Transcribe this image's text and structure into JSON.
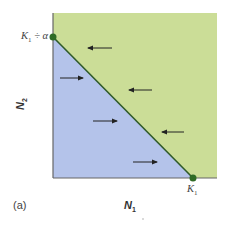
{
  "figure": {
    "panel_label": "(a)",
    "x_axis": {
      "label": "N",
      "label_sub": "1",
      "intercept_label": "K",
      "intercept_sub": "1"
    },
    "y_axis": {
      "label": "N",
      "label_sub": "2",
      "intercept_label": "K",
      "intercept_sub": "1",
      "intercept_suffix": " ÷ α"
    },
    "regions": [
      {
        "name": "above-isocline",
        "color": "#cbdd97",
        "arrow_direction": "left"
      },
      {
        "name": "below-isocline",
        "color": "#b4c3ea",
        "arrow_direction": "right"
      }
    ],
    "isocline_color": "#2f5a2a",
    "point_color": "#2f6b25",
    "axis_color": "#666666",
    "arrows": [
      {
        "x1": 112,
        "x2": 88,
        "y": 48,
        "direction": "left"
      },
      {
        "x1": 60,
        "x2": 83,
        "y": 78,
        "direction": "right"
      },
      {
        "x1": 152,
        "x2": 129,
        "y": 90,
        "direction": "left"
      },
      {
        "x1": 93,
        "x2": 117,
        "y": 121,
        "direction": "right"
      },
      {
        "x1": 184,
        "x2": 162,
        "y": 132,
        "direction": "left"
      },
      {
        "x1": 133,
        "x2": 157,
        "y": 162,
        "direction": "right"
      }
    ]
  }
}
